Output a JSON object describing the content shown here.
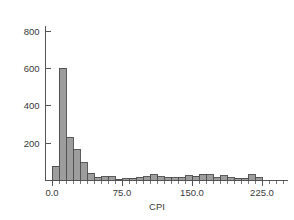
{
  "chart_data": {
    "type": "bar",
    "title": "",
    "subtitle": "",
    "xlabel": "CPI",
    "ylabel": "",
    "xlim": [
      -7.5,
      262.5
    ],
    "ylim": [
      0,
      830
    ],
    "grid": false,
    "legend": null,
    "bin_width": 7.5,
    "x_tick_labels": [
      "0.0",
      "75.0",
      "150.0",
      "225.0"
    ],
    "x_tick_values": [
      0,
      75,
      150,
      225
    ],
    "y_tick_labels": [
      "200",
      "400",
      "600",
      "800"
    ],
    "y_tick_values": [
      200,
      400,
      600,
      800
    ],
    "categories": [
      "0.0",
      "7.5",
      "15.0",
      "22.5",
      "30.0",
      "37.5",
      "45.0",
      "52.5",
      "60.0",
      "67.5",
      "75.0",
      "82.5",
      "90.0",
      "97.5",
      "105.0",
      "112.5",
      "120.0",
      "127.5",
      "135.0",
      "142.5",
      "150.0",
      "157.5",
      "165.0",
      "172.5",
      "180.0",
      "187.5",
      "195.0",
      "202.5",
      "210.0",
      "217.5"
    ],
    "values": [
      75,
      600,
      230,
      165,
      95,
      40,
      18,
      20,
      20,
      8,
      10,
      12,
      16,
      20,
      30,
      20,
      14,
      14,
      16,
      26,
      22,
      34,
      30,
      14,
      26,
      14,
      12,
      12,
      30,
      18
    ],
    "bar_fill_color": "#9d9d9d",
    "bar_edge_color": "#4a4a4a",
    "axis_color": "#555555",
    "text_color": "#3a3a3a",
    "background_color": "#ffffff"
  },
  "axes": {
    "x_axis_name": "CPI",
    "y_axis_name": ""
  }
}
